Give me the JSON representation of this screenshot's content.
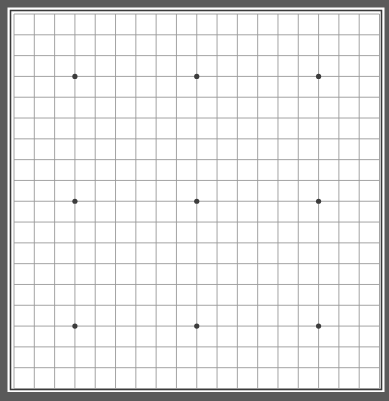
{
  "board": {
    "size": 19,
    "colors": {
      "frame": "#5a5a5a",
      "gap": "#ffffff",
      "inner_border": "#3a3a3a",
      "surface": "#ffffff",
      "grid_line": "#9a9a9a",
      "star_point": "#3c3c3c"
    },
    "star_points": [
      {
        "col": 3,
        "row": 3
      },
      {
        "col": 9,
        "row": 3
      },
      {
        "col": 15,
        "row": 3
      },
      {
        "col": 3,
        "row": 9
      },
      {
        "col": 9,
        "row": 9
      },
      {
        "col": 15,
        "row": 9
      },
      {
        "col": 3,
        "row": 15
      },
      {
        "col": 9,
        "row": 15
      },
      {
        "col": 15,
        "row": 15
      }
    ],
    "stones": []
  }
}
